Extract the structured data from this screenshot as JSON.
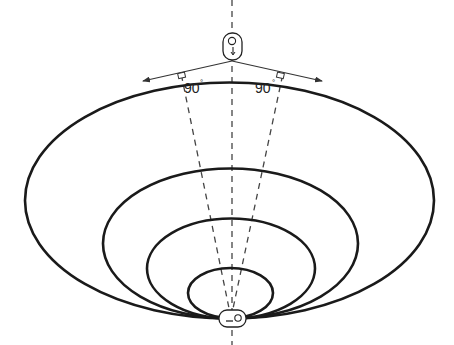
{
  "diagram": {
    "type": "antenna-radiation-pattern",
    "angle_labels": [
      {
        "value": "90",
        "unit": "°"
      },
      {
        "value": "90",
        "unit": "°"
      }
    ],
    "colors": {
      "stroke": "#1a1a1a",
      "dashed": "#444444",
      "background": "#ffffff"
    },
    "lobes": [
      {
        "cx": 229.5,
        "cy": 200.5,
        "rx": 204.5,
        "ry": 118
      },
      {
        "cx": 230.5,
        "cy": 243.5,
        "rx": 127.5,
        "ry": 75
      },
      {
        "cx": 231,
        "cy": 268.5,
        "rx": 84,
        "ry": 50
      },
      {
        "cx": 230.5,
        "cy": 293,
        "rx": 42.5,
        "ry": 25
      }
    ]
  }
}
